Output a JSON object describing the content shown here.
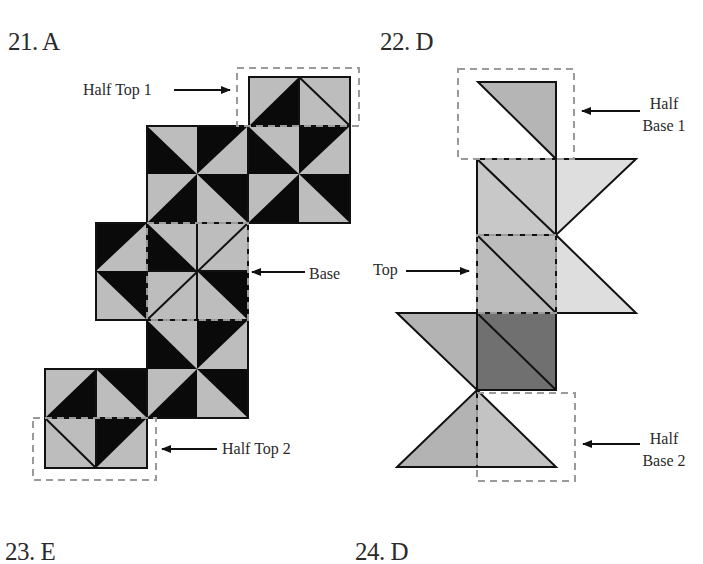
{
  "answers": [
    {
      "number": "21",
      "choice": "A",
      "text": "21. A"
    },
    {
      "number": "22",
      "choice": "D",
      "text": "22. D"
    },
    {
      "number": "23",
      "choice": "E",
      "text": "23. E"
    },
    {
      "number": "24",
      "choice": "D",
      "text": "24. D"
    }
  ],
  "figure21": {
    "labels": {
      "half_top_1": "Half Top 1",
      "base": "Base",
      "half_top_2": "Half Top 2"
    }
  },
  "figure22": {
    "labels": {
      "half_base_1_line1": "Half",
      "half_base_1_line2": "Base 1",
      "top": "Top",
      "half_base_2_line1": "Half",
      "half_base_2_line2": "Base 2"
    }
  },
  "colors": {
    "black": "#0a0a0a",
    "light_gray": "#bdbdbd",
    "mid_gray": "#a9a9a9",
    "pale_gray": "#d9d9d9",
    "dark_gray": "#6e6e6e",
    "dashed_outline": "#9a9a9a"
  }
}
